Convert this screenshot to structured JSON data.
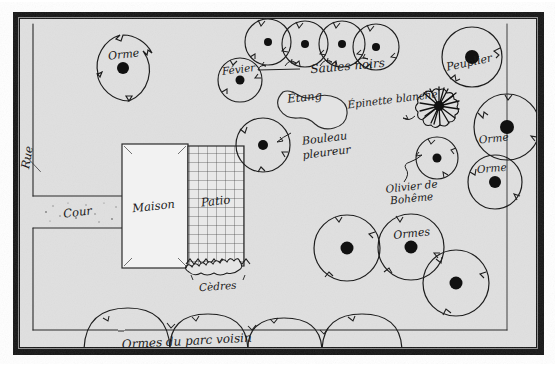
{
  "document": {
    "title": "Plan d'aménagement paysager",
    "kind": "hand-drawn-site-plan",
    "language": "fr"
  },
  "palette": {
    "paper": "#e0e0e0",
    "paper_light": "#e6e6e6",
    "ink": "#1a1a1a",
    "frame_outer": "#161616",
    "frame_inner": "#3a3a3a",
    "page_white": "#ffffff",
    "building_fill": "#f2f2f2",
    "patio_fill": "#e9e9e9"
  },
  "frame": {
    "margin_label": "white page margin",
    "border_label": "black photographic border"
  },
  "labels": {
    "rue": "Rue",
    "cour": "Cour",
    "maison": "Maison",
    "patio": "Patio",
    "cedres": "Cèdres",
    "etang": "Étang",
    "epinette_blanche": "Épinette blanche",
    "bouleau_pleureur": "Bouleau pleureur",
    "olivier_de_boheme": "Olivier de Bohême",
    "saules_noirs": "Saules noirs",
    "peuplier": "Peuplier",
    "fevier": "Févier",
    "orme_top_left": "Orme",
    "orme_right_upper": "Orme",
    "orme_right_lower": "Orme",
    "ormes_bottom": "Ormes",
    "ormes_parc_voisin": "Ormes du parc voisin"
  },
  "plants": [
    {
      "id": "orme-top-left",
      "name": "Orme",
      "cx": 123,
      "cy": 68,
      "r": 33,
      "dot": 6,
      "label_dx": 0,
      "label_dy": -10
    },
    {
      "id": "fevier",
      "name": "Févier",
      "cx": 240,
      "cy": 80,
      "r": 22,
      "dot": 4.5,
      "label_dx": 0,
      "label_dy": -8
    },
    {
      "id": "saule-noir-1",
      "name": "Saule noir",
      "cx": 268,
      "cy": 42,
      "r": 23,
      "dot": 4,
      "label_dx": 0,
      "label_dy": 0
    },
    {
      "id": "saule-noir-2",
      "name": "Saule noir",
      "cx": 305,
      "cy": 44,
      "r": 23,
      "dot": 4,
      "label_dx": 0,
      "label_dy": 0
    },
    {
      "id": "saule-noir-3",
      "name": "Saule noir",
      "cx": 342,
      "cy": 44,
      "r": 23,
      "dot": 4,
      "label_dx": 0,
      "label_dy": 0
    },
    {
      "id": "saule-noir-4",
      "name": "Saule noir",
      "cx": 376,
      "cy": 47,
      "r": 23,
      "dot": 4,
      "label_dx": 0,
      "label_dy": 0
    },
    {
      "id": "peuplier",
      "name": "Peuplier",
      "cx": 472,
      "cy": 57,
      "r": 30,
      "dot": 7,
      "label_dx": 0,
      "label_dy": 7
    },
    {
      "id": "bouleau-pleureur",
      "name": "Bouleau pleureur",
      "cx": 263,
      "cy": 145,
      "r": 27,
      "dot": 5,
      "label_dx": 0,
      "label_dy": 0
    },
    {
      "id": "olivier-boheme",
      "name": "Olivier de Bohême",
      "cx": 437,
      "cy": 158,
      "r": 21,
      "dot": 4.5,
      "label_dx": 0,
      "label_dy": 0
    },
    {
      "id": "orme-right-upper",
      "name": "Orme",
      "cx": 507,
      "cy": 127,
      "r": 33,
      "dot": 7,
      "label_dx": -12,
      "label_dy": 14
    },
    {
      "id": "orme-right-lower",
      "name": "Orme",
      "cx": 495,
      "cy": 182,
      "r": 27,
      "dot": 6,
      "label_dx": -6,
      "label_dy": 0
    },
    {
      "id": "orme-bottom-1",
      "name": "Orme",
      "cx": 347,
      "cy": 248,
      "r": 33,
      "dot": 6.5,
      "label_dx": 0,
      "label_dy": 0
    },
    {
      "id": "orme-bottom-2",
      "name": "Orme",
      "cx": 411,
      "cy": 247,
      "r": 33,
      "dot": 6.5,
      "label_dx": 0,
      "label_dy": -10
    },
    {
      "id": "orme-bottom-3",
      "name": "Orme",
      "cx": 456,
      "cy": 283,
      "r": 33,
      "dot": 6.5,
      "label_dx": 0,
      "label_dy": 0
    },
    {
      "id": "epinette-blanche",
      "name": "Épinette blanche",
      "cx": 439,
      "cy": 106,
      "r": 19,
      "dot": 5,
      "label_dx": 0,
      "label_dy": 0
    }
  ],
  "structures": [
    {
      "id": "maison",
      "name": "Maison",
      "x": 122,
      "y": 144,
      "w": 66,
      "h": 124
    },
    {
      "id": "patio",
      "name": "Patio",
      "x": 188,
      "y": 146,
      "w": 56,
      "h": 120
    },
    {
      "id": "cour",
      "name": "Cour",
      "x": 33,
      "y": 196,
      "w": 90,
      "h": 32
    }
  ],
  "features": {
    "etang": {
      "name": "Étang",
      "cx": 307,
      "cy": 104,
      "note": "bassin en forme de haricot"
    },
    "cedres": {
      "name": "Cèdres",
      "note": "haie dentelée sous le patio"
    },
    "property_line": {
      "name": "ligne de lot",
      "orientation": "verticale",
      "x": 497
    },
    "hedge_bottom": {
      "name": "Ormes du parc voisin",
      "count": 4,
      "note": "arcs de couronnes débordants"
    }
  },
  "counts": {
    "ormes_total": 6,
    "saules_noirs": 4,
    "ormes_parc_voisin": 4
  }
}
